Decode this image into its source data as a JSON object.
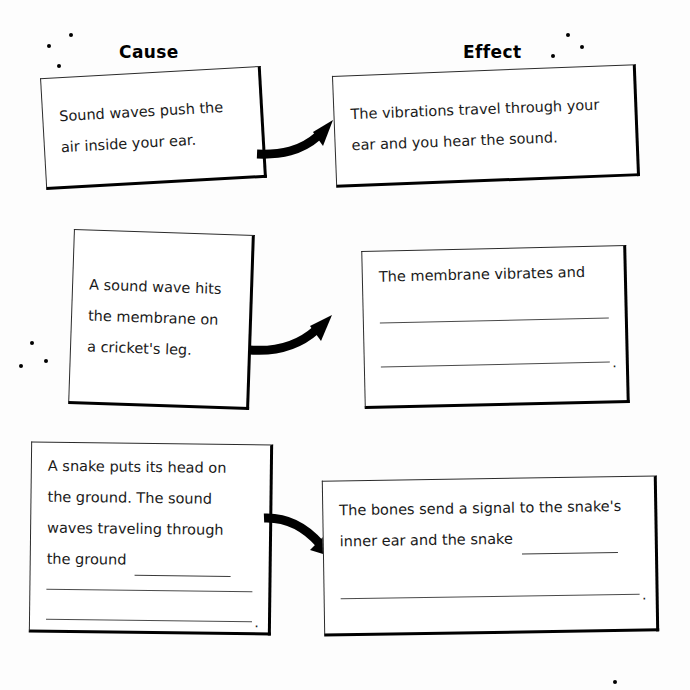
{
  "worksheet": {
    "headers": {
      "cause": "Cause",
      "effect": "Effect"
    },
    "rows": [
      {
        "id": "row-1",
        "cause": {
          "lines": [
            "Sound waves push the",
            "air inside your ear."
          ],
          "blank_lines": 0,
          "ends_with_period_blank": false
        },
        "effect": {
          "lines": [
            "The vibrations travel through your",
            "ear and you hear the sound."
          ],
          "blank_lines": 0,
          "ends_with_period_blank": false
        },
        "connector": "curved-arrow-right"
      },
      {
        "id": "row-2",
        "cause": {
          "lines": [
            "A sound wave hits",
            "the membrane on",
            "a cricket's leg."
          ],
          "blank_lines": 0,
          "ends_with_period_blank": false
        },
        "effect": {
          "lines": [
            "The membrane vibrates and"
          ],
          "blank_lines": 2,
          "ends_with_period_blank": true
        },
        "connector": "curved-arrow-right"
      },
      {
        "id": "row-3",
        "cause": {
          "lines": [
            "A snake puts its head on",
            "the ground. The sound",
            "waves traveling through",
            "the ground"
          ],
          "last_line_has_inline_blank": true,
          "blank_lines": 2,
          "ends_with_period_blank": true
        },
        "effect": {
          "lines": [
            "The bones send a signal to the snake's",
            "inner ear and the snake"
          ],
          "last_line_has_inline_blank": true,
          "blank_lines": 1,
          "ends_with_period_blank": true
        },
        "connector": "curved-arrow-right"
      }
    ],
    "decorative_dots": [
      {
        "x": 47,
        "y": 44
      },
      {
        "x": 69,
        "y": 33
      },
      {
        "x": 57,
        "y": 64
      },
      {
        "x": 566,
        "y": 33
      },
      {
        "x": 551,
        "y": 54
      },
      {
        "x": 580,
        "y": 45
      },
      {
        "x": 30,
        "y": 341
      },
      {
        "x": 19,
        "y": 364
      },
      {
        "x": 44,
        "y": 359
      },
      {
        "x": 613,
        "y": 680
      }
    ],
    "colors": {
      "ink": "#111111",
      "box_border": "#2b2b2b",
      "box_shadow_edge": "#000000",
      "paper": "#fdfdfd",
      "rule_line": "#4a4a4a"
    }
  }
}
